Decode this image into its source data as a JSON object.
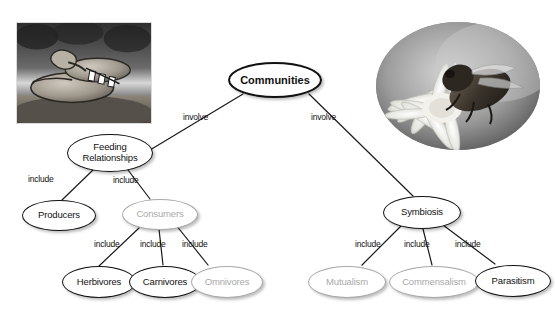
{
  "diagram": {
    "colors": {
      "node_stroke": "#111111",
      "node_fill": "#ffffff",
      "blank_stroke": "#a9a9a9",
      "blank_text": "#a9a9a9",
      "text": "#111111",
      "edge": "#1a1a1a"
    },
    "images": [
      {
        "name": "rattlesnake-photo",
        "caption": "",
        "shape": "rectangle",
        "subject": "rattlesnake coiled on rocky ground"
      },
      {
        "name": "bee-on-flower-photo",
        "caption": "",
        "shape": "circle",
        "subject": "bee feeding on a white flower"
      }
    ],
    "nodes": [
      {
        "id": "communities",
        "label": "Communities",
        "style": "root",
        "filled": true
      },
      {
        "id": "feeding",
        "label": "Feeding\nRelationships",
        "line1": "Feeding",
        "line2": "Relationships",
        "style": "normal",
        "filled": true
      },
      {
        "id": "symbiosis",
        "label": "Symbiosis",
        "style": "normal",
        "filled": true
      },
      {
        "id": "producers",
        "label": "Producers",
        "style": "normal",
        "filled": true
      },
      {
        "id": "consumers",
        "label": "Consumers",
        "style": "blank",
        "filled": false
      },
      {
        "id": "herbivores",
        "label": "Herbivores",
        "style": "normal",
        "filled": true
      },
      {
        "id": "carnivores",
        "label": "Carnivores",
        "style": "normal",
        "filled": true
      },
      {
        "id": "omnivores",
        "label": "Omnivores",
        "style": "blank",
        "filled": false
      },
      {
        "id": "mutualism",
        "label": "Mutualism",
        "style": "blank",
        "filled": false
      },
      {
        "id": "commensalism",
        "label": "Commensalism",
        "style": "blank",
        "filled": false
      },
      {
        "id": "parasitism",
        "label": "Parasitism",
        "style": "normal",
        "filled": true
      }
    ],
    "edges": [
      {
        "from": "communities",
        "to": "feeding",
        "label": "involve"
      },
      {
        "from": "communities",
        "to": "symbiosis",
        "label": "involve"
      },
      {
        "from": "feeding",
        "to": "producers",
        "label": "include"
      },
      {
        "from": "feeding",
        "to": "consumers",
        "label": "include"
      },
      {
        "from": "consumers",
        "to": "herbivores",
        "label": "include"
      },
      {
        "from": "consumers",
        "to": "carnivores",
        "label": "include"
      },
      {
        "from": "consumers",
        "to": "omnivores",
        "label": "include"
      },
      {
        "from": "symbiosis",
        "to": "mutualism",
        "label": "include"
      },
      {
        "from": "symbiosis",
        "to": "commensalism",
        "label": "include"
      },
      {
        "from": "symbiosis",
        "to": "parasitism",
        "label": "include"
      }
    ]
  }
}
